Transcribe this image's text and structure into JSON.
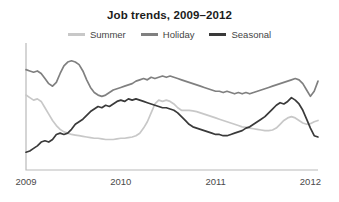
{
  "chart_data": {
    "type": "line",
    "title": "Job trends, 2009–2012",
    "xlabel": "",
    "ylabel": "",
    "grid": false,
    "legend_position": "top-center",
    "x": [
      2009.0,
      2009.04,
      2009.08,
      2009.12,
      2009.16,
      2009.2,
      2009.24,
      2009.28,
      2009.32,
      2009.36,
      2009.4,
      2009.44,
      2009.48,
      2009.52,
      2009.56,
      2009.6,
      2009.64,
      2009.68,
      2009.72,
      2009.76,
      2009.8,
      2009.84,
      2009.88,
      2009.92,
      2009.96,
      2010.0,
      2010.04,
      2010.08,
      2010.12,
      2010.16,
      2010.2,
      2010.24,
      2010.28,
      2010.32,
      2010.36,
      2010.4,
      2010.44,
      2010.48,
      2010.52,
      2010.56,
      2010.6,
      2010.64,
      2010.68,
      2010.72,
      2010.76,
      2010.8,
      2010.84,
      2010.88,
      2010.92,
      2010.96,
      2011.0,
      2011.04,
      2011.08,
      2011.12,
      2011.16,
      2011.2,
      2011.24,
      2011.28,
      2011.32,
      2011.36,
      2011.4,
      2011.44,
      2011.48,
      2011.52,
      2011.56,
      2011.6,
      2011.64,
      2011.68,
      2011.72,
      2011.76,
      2011.8,
      2011.84,
      2011.88,
      2011.92,
      2011.96,
      2012.0,
      2012.04,
      2012.08
    ],
    "xlim": [
      2009.0,
      2012.08
    ],
    "ylim": [
      0,
      100
    ],
    "xticks": [
      2009,
      2010,
      2011,
      2012
    ],
    "xticklabels": [
      "2009",
      "2010",
      "2011",
      "2012"
    ],
    "series": [
      {
        "name": "Summer",
        "color": "#c8c8c8",
        "values": [
          59,
          57,
          55,
          56,
          54,
          49,
          44,
          39,
          35,
          32,
          30,
          29,
          28,
          27.5,
          27,
          26.5,
          26,
          25.5,
          25,
          25,
          24.5,
          24,
          24,
          24,
          24.5,
          25,
          25,
          25.5,
          26,
          27,
          29,
          33,
          38,
          45,
          52,
          55,
          54,
          55,
          54,
          52,
          49,
          47,
          47,
          47,
          46.5,
          46,
          45,
          44,
          43,
          42,
          41,
          40,
          39,
          38,
          37,
          36,
          35,
          34,
          33.5,
          33,
          32.5,
          32,
          31.5,
          31,
          31,
          31.5,
          33,
          36,
          39,
          41,
          42,
          41,
          39,
          37,
          36,
          36.5,
          38,
          39
        ]
      },
      {
        "name": "Holiday",
        "color": "#808080",
        "values": [
          79,
          78,
          77,
          78,
          76,
          72,
          68,
          66,
          69,
          76,
          82,
          85,
          86,
          85,
          83,
          78,
          71,
          65,
          61,
          59,
          58,
          59,
          61,
          63,
          64,
          65,
          66,
          67,
          68,
          70,
          71,
          72,
          71,
          73,
          72,
          73,
          74,
          73,
          74,
          73,
          72,
          71,
          70,
          69,
          68,
          67,
          66,
          65,
          64,
          63,
          62,
          62,
          61,
          62,
          61,
          60,
          61,
          60,
          61,
          60,
          61,
          62,
          63,
          64,
          65,
          66,
          67,
          68,
          69,
          70,
          71,
          72,
          71,
          68,
          63,
          58,
          62,
          70
        ]
      },
      {
        "name": "Seasonal",
        "color": "#3a3a3a",
        "values": [
          14,
          15,
          17,
          19,
          22,
          23,
          22,
          24,
          28,
          29,
          28,
          29,
          32,
          36,
          38,
          40,
          43,
          46,
          48,
          50,
          49,
          51,
          50,
          52,
          54,
          55,
          54,
          56,
          55,
          56,
          55,
          54,
          53,
          52,
          51,
          50,
          49,
          49,
          48,
          47,
          45,
          42,
          39,
          36,
          34,
          33,
          32,
          31,
          30,
          29,
          28,
          28,
          27,
          27,
          28,
          29,
          30,
          31,
          33,
          34,
          36,
          38,
          40,
          42,
          45,
          48,
          51,
          53,
          52,
          54,
          57,
          55,
          52,
          47,
          40,
          33,
          27,
          26
        ]
      }
    ]
  },
  "plot": {
    "axis_color": "#b9b9b9"
  }
}
